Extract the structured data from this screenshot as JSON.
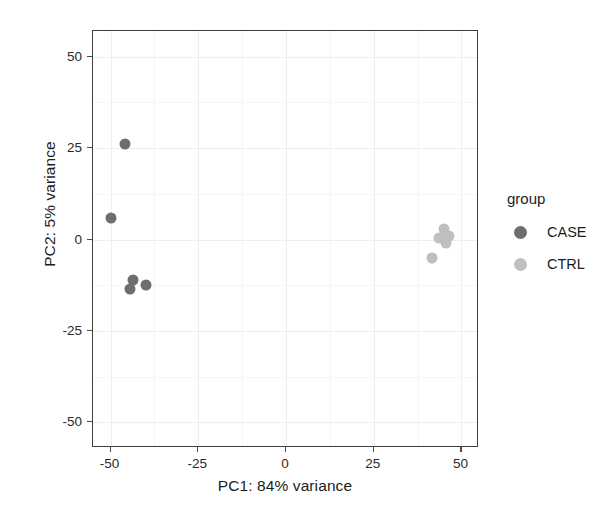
{
  "chart_data": {
    "type": "scatter",
    "title": "",
    "xlabel": "PC1: 84% variance",
    "ylabel": "PC2: 5% variance",
    "xlim": [
      -55,
      55
    ],
    "ylim": [
      -57,
      57
    ],
    "xticks": [
      -50,
      -25,
      0,
      25,
      50
    ],
    "yticks": [
      -50,
      -25,
      0,
      25,
      50
    ],
    "xticklabels": [
      "-50",
      "-25",
      "0",
      "25",
      "50"
    ],
    "yticklabels": [
      "-50",
      "-25",
      "0",
      "25",
      "50"
    ],
    "grid": true,
    "legend": {
      "title": "group",
      "position": "right",
      "entries": [
        {
          "label": "CASE",
          "color": "#6e6e6e"
        },
        {
          "label": "CTRL",
          "color": "#bfbfbf"
        }
      ]
    },
    "series": [
      {
        "name": "CASE",
        "color": "#6e6e6e",
        "marker": "circle",
        "marker_size": 11,
        "points": [
          {
            "x": -46.0,
            "y": 26.0
          },
          {
            "x": -50.0,
            "y": 6.0
          },
          {
            "x": -43.5,
            "y": -11.0
          },
          {
            "x": -44.5,
            "y": -13.5
          },
          {
            "x": -40.0,
            "y": -12.5
          }
        ]
      },
      {
        "name": "CTRL",
        "color": "#bfbfbf",
        "marker": "circle",
        "marker_size": 11,
        "points": [
          {
            "x": 45.0,
            "y": 3.0
          },
          {
            "x": 43.5,
            "y": 0.5
          },
          {
            "x": 46.5,
            "y": 1.0
          },
          {
            "x": 45.5,
            "y": -1.0
          },
          {
            "x": 41.5,
            "y": -5.0
          }
        ]
      }
    ]
  },
  "axes": {
    "x_title": "PC1: 84% variance",
    "y_title": "PC2: 5% variance"
  },
  "legend": {
    "title": "group",
    "items": [
      {
        "label": "CASE",
        "color": "#6e6e6e"
      },
      {
        "label": "CTRL",
        "color": "#bfbfbf"
      }
    ]
  },
  "theme": {
    "panel_background": "#ffffff",
    "panel_border": "#3f3f3f",
    "gridline_color": "#eeeeee",
    "text_color": "#1c1c1c"
  }
}
